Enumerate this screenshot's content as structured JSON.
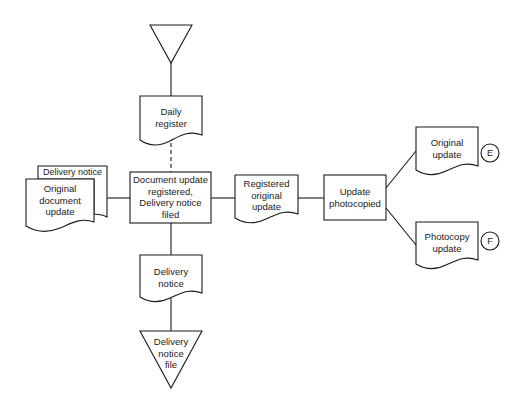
{
  "diagram": {
    "type": "document flowchart",
    "nodes": {
      "top_file": {
        "shape": "inverted-triangle",
        "label": ""
      },
      "daily_register": {
        "shape": "document",
        "label": "Daily\nregister"
      },
      "delivery_notice_back": {
        "shape": "document",
        "label": "Delivery notice"
      },
      "original_document_update": {
        "shape": "document",
        "label": "Original\ndocument\nupdate"
      },
      "main_process": {
        "shape": "process",
        "label": "Document update\nregistered,\nDelivery notice\nfiled"
      },
      "registered_original_update": {
        "shape": "document",
        "label": "Registered\noriginal\nupdate"
      },
      "update_photocopied": {
        "shape": "process",
        "label": "Update\nphotocopied"
      },
      "original_update": {
        "shape": "document",
        "label": "Original\nupdate"
      },
      "photocopy_update": {
        "shape": "document",
        "label": "Photocopy\nupdate"
      },
      "delivery_notice": {
        "shape": "document",
        "label": "Delivery\nnotice"
      },
      "delivery_notice_file": {
        "shape": "inverted-triangle",
        "label": "Delivery\nnotice\nfile"
      },
      "connector_e": {
        "shape": "circle",
        "label": "E"
      },
      "connector_f": {
        "shape": "circle",
        "label": "F"
      }
    },
    "edges": [
      {
        "from": "top_file",
        "to": "daily_register",
        "style": "solid"
      },
      {
        "from": "daily_register",
        "to": "main_process",
        "style": "dashed"
      },
      {
        "from": "original_document_update",
        "to": "main_process",
        "style": "solid"
      },
      {
        "from": "main_process",
        "to": "registered_original_update",
        "style": "solid"
      },
      {
        "from": "registered_original_update",
        "to": "update_photocopied",
        "style": "solid"
      },
      {
        "from": "update_photocopied",
        "to": "original_update",
        "style": "solid"
      },
      {
        "from": "update_photocopied",
        "to": "photocopy_update",
        "style": "solid"
      },
      {
        "from": "main_process",
        "to": "delivery_notice",
        "style": "solid"
      },
      {
        "from": "delivery_notice",
        "to": "delivery_notice_file",
        "style": "solid"
      }
    ]
  }
}
